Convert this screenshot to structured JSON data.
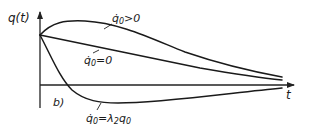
{
  "figure": {
    "panel_label": "b)",
    "y_axis_label": "q(t)",
    "x_axis_label": "t"
  },
  "curves": [
    {
      "id": "positive-velocity",
      "label": "q̇₀>0",
      "label_main": "q̇",
      "label_sub": "0",
      "label_rest": ">0",
      "behavior": "rises to a maximum then decays toward zero"
    },
    {
      "id": "zero-velocity",
      "label": "q̇₀=0",
      "label_main": "q̇",
      "label_sub": "0",
      "label_rest": "=0",
      "behavior": "monotonic decay toward zero"
    },
    {
      "id": "lambda-velocity",
      "label": "q̇₀=λ₂q₀",
      "label_main": "q̇",
      "label_sub": "0",
      "label_rest": "=λ",
      "label_sub2": "2",
      "label_rest2": "q",
      "label_sub3": "0",
      "behavior": "crosses zero, reaches a minimum, then approaches zero from below"
    }
  ],
  "colors": {
    "ink": "#1a1a1a",
    "background": "#ffffff"
  }
}
